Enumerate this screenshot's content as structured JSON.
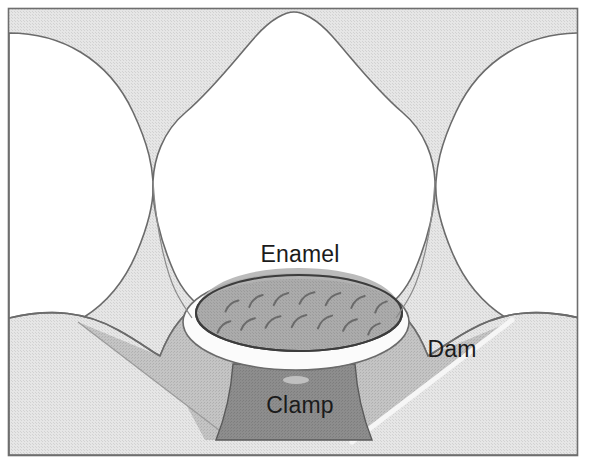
{
  "figure": {
    "canvas": {
      "width": 589,
      "height": 470
    },
    "background_color": "#ffffff",
    "border_color": "#6e6e6e",
    "frame": {
      "x": 8,
      "y": 8,
      "width": 570,
      "height": 448
    }
  },
  "labels": {
    "enamel": "Enamel",
    "dam": "Dam",
    "clamp": "Clamp"
  },
  "label_positions": {
    "enamel": {
      "x": 300,
      "y": 262
    },
    "dam": {
      "x": 452,
      "y": 357
    },
    "clamp": {
      "x": 300,
      "y": 413
    }
  },
  "colors": {
    "tooth_enamel_white": "#ffffff",
    "adjacent_tooth_gray": "#e3e3e3",
    "dam_sheet_light": "#dcdcdc",
    "dam_fold_mid": "#b9b9b9",
    "cavity_floor_gray": "#a7a7a7",
    "clamp_dark_gray": "#8a8a8a",
    "outline": "#4a4a4a",
    "hatch_stroke": "#6a6a6a",
    "highlight_white": "#f4f4f4",
    "label_text": "#1b1b1b"
  },
  "parts": [
    {
      "name": "adjacent-tooth-left",
      "description": "Proximal tooth at left, pinched at contact point"
    },
    {
      "name": "adjacent-tooth-right",
      "description": "Proximal tooth at right, pinched at contact point"
    },
    {
      "name": "isolated-tooth",
      "description": "Central white enamel crown under the dam"
    },
    {
      "name": "rubber-dam-sheet",
      "description": "Light gray sheet draped over the arch"
    },
    {
      "name": "dam-fold-left",
      "description": "Darker diagonal fold wedge on left"
    },
    {
      "name": "dam-fold-right",
      "description": "Darker diagonal fold wedge on right with white crease"
    },
    {
      "name": "cavity-preparation",
      "description": "Gray elliptical occlusal opening with hatching"
    },
    {
      "name": "enamel-collar",
      "description": "White enamel rim ringing the cavity opening"
    },
    {
      "name": "clamp-body",
      "description": "Dark gray trapezoid clamp beneath the tooth"
    }
  ],
  "cavity_hatch_marks": [
    {
      "x": 232,
      "y": 306,
      "len": 17,
      "angle": -40
    },
    {
      "x": 256,
      "y": 301,
      "len": 18,
      "angle": -42
    },
    {
      "x": 281,
      "y": 299,
      "len": 19,
      "angle": -40
    },
    {
      "x": 307,
      "y": 298,
      "len": 19,
      "angle": -38
    },
    {
      "x": 333,
      "y": 299,
      "len": 19,
      "angle": -40
    },
    {
      "x": 358,
      "y": 302,
      "len": 18,
      "angle": -42
    },
    {
      "x": 381,
      "y": 307,
      "len": 16,
      "angle": -44
    },
    {
      "x": 224,
      "y": 327,
      "len": 17,
      "angle": -42
    },
    {
      "x": 248,
      "y": 324,
      "len": 18,
      "angle": -40
    },
    {
      "x": 273,
      "y": 322,
      "len": 19,
      "angle": -38
    },
    {
      "x": 299,
      "y": 321,
      "len": 19,
      "angle": -40
    },
    {
      "x": 325,
      "y": 322,
      "len": 19,
      "angle": -42
    },
    {
      "x": 350,
      "y": 325,
      "len": 18,
      "angle": -40
    },
    {
      "x": 374,
      "y": 329,
      "len": 16,
      "angle": -44
    }
  ]
}
